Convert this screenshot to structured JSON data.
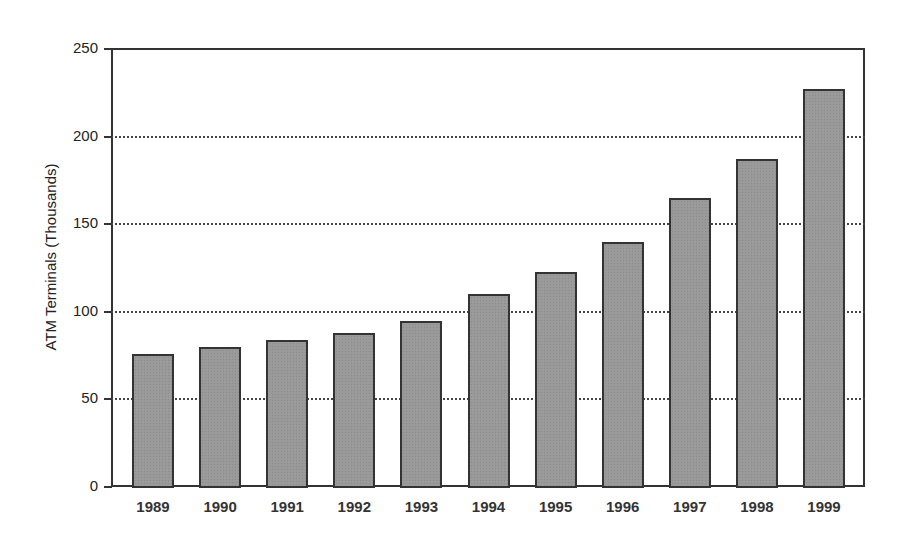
{
  "chart_data": {
    "type": "bar",
    "title": "",
    "xlabel": "",
    "ylabel": "ATM Terminals (Thousands)",
    "categories": [
      "1989",
      "1990",
      "1991",
      "1992",
      "1993",
      "1994",
      "1995",
      "1996",
      "1997",
      "1998",
      "1999"
    ],
    "values": [
      76,
      80,
      84,
      88,
      95,
      110,
      123,
      140,
      165,
      187,
      227
    ],
    "ylim": [
      0,
      250
    ],
    "yticks": [
      0,
      50,
      100,
      150,
      200,
      250
    ],
    "grid": "horizontal dotted",
    "legend": null,
    "bar_color": "#9a9a9a"
  }
}
